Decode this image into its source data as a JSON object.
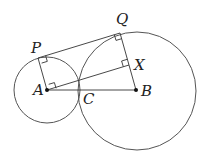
{
  "diagram": {
    "colors": {
      "line": "#555555",
      "text": "#222222",
      "point": "#111111",
      "background": "#ffffff"
    },
    "points": {
      "A": {
        "label": "A",
        "x": 47,
        "y": 90,
        "role": "center of small circle"
      },
      "B": {
        "label": "B",
        "x": 136,
        "y": 90,
        "role": "center of large circle"
      },
      "C": {
        "label": "C",
        "x": 80,
        "y": 90,
        "role": "point of tangency"
      },
      "P": {
        "label": "P",
        "x": 38,
        "y": 58,
        "role": "tangent point on small circle"
      },
      "Q": {
        "label": "Q",
        "x": 120,
        "y": 33,
        "role": "tangent point on large circle"
      },
      "X": {
        "label": "X",
        "x": 129,
        "y": 65,
        "role": "foot on QB"
      }
    },
    "circles": [
      {
        "name": "small-circle",
        "center": "A",
        "r": 33
      },
      {
        "name": "large-circle",
        "center": "B",
        "r": 59
      }
    ],
    "segments": [
      "PQ",
      "AP",
      "QB",
      "AX",
      "AB"
    ],
    "right_angles": [
      "P",
      "Q",
      "X"
    ]
  }
}
